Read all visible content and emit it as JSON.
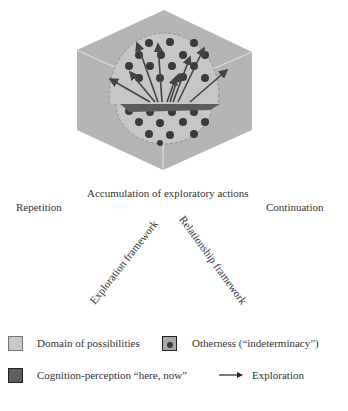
{
  "colors": {
    "cube_face": "#b3b3b3",
    "cube_edge": "#d9d9d9",
    "sphere_fill": "#c4c4c4",
    "dot": "#3a3a3a",
    "plane": "#5a5a5a",
    "arrow": "#444444",
    "text": "#333333"
  },
  "diagram": {
    "top_label": "Accumulation of exploratory actions",
    "left_label": "Repetition",
    "right_label": "Continuation",
    "left_diagonal_label": "Exploration framework",
    "right_diagonal_label": "Relationship framework"
  },
  "legend": {
    "items": [
      {
        "label": "Domain of possibilities",
        "symbol": "light-square"
      },
      {
        "label": "Otherness (“indeterminacy”)",
        "symbol": "dot-square"
      },
      {
        "label": "Cognition-perception “here, now”",
        "symbol": "dark-square"
      },
      {
        "label": "Exploration",
        "symbol": "arrow"
      }
    ]
  }
}
